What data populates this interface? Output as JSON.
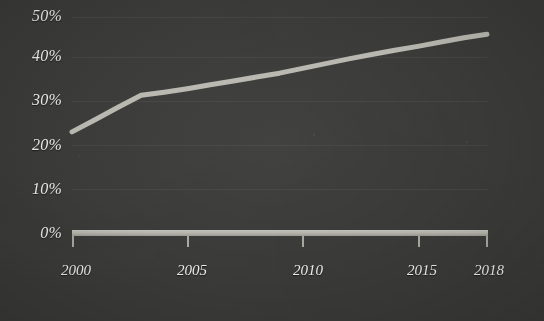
{
  "chart_data": {
    "type": "line",
    "title": "",
    "subtitle": "",
    "xlabel": "",
    "ylabel": "",
    "xlim": [
      2000,
      2018
    ],
    "ylim": [
      0,
      50
    ],
    "grid": true,
    "legend": "none",
    "y_tick_labels": [
      "50%",
      "40%",
      "30%",
      "20%",
      "10%",
      "0%"
    ],
    "y_ticks": [
      50,
      40,
      30,
      20,
      10,
      0
    ],
    "x_tick_labels": [
      "2000",
      "2005",
      "2010",
      "2015",
      "2018"
    ],
    "x_ticks": [
      2000,
      2005,
      2010,
      2015,
      2018
    ],
    "series": [
      {
        "name": "share",
        "color": "#b8b8b0",
        "x": [
          2000,
          2001,
          2002,
          2003,
          2004,
          2005,
          2006,
          2007,
          2008,
          2009,
          2010,
          2011,
          2012,
          2013,
          2014,
          2015,
          2016,
          2017,
          2018
        ],
        "values": [
          23.4,
          26.2,
          29.1,
          31.9,
          32.6,
          33.4,
          34.3,
          35.2,
          36.1,
          37.0,
          38.1,
          39.2,
          40.3,
          41.3,
          42.3,
          43.2,
          44.2,
          45.2,
          46.0
        ]
      }
    ]
  },
  "style": {
    "background_color": "#3b3b39",
    "line_color": "#b8b8b0",
    "axis_color": "#b2b2aa",
    "tick_color": "#a9a9a1",
    "label_color": "#f0f0ea",
    "gridline_color": "rgba(255,255,255,0.055)"
  }
}
